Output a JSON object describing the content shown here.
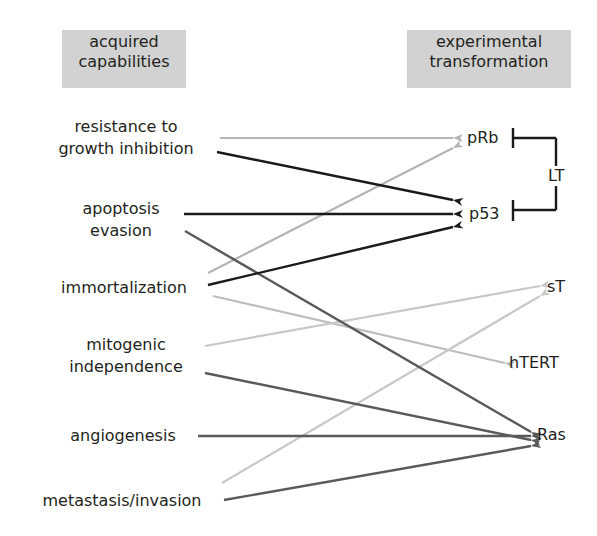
{
  "headers": {
    "left": [
      "acquired",
      "capabilities"
    ],
    "right": [
      "experimental",
      "transformation"
    ]
  },
  "capabilities": [
    {
      "id": "resistance",
      "lines": [
        "resistance to",
        "growth inhibition"
      ]
    },
    {
      "id": "apoptosis",
      "lines": [
        "apoptosis",
        "evasion"
      ]
    },
    {
      "id": "immortalization",
      "lines": [
        "immortalization"
      ]
    },
    {
      "id": "mitogenic",
      "lines": [
        "mitogenic",
        "independence"
      ]
    },
    {
      "id": "angiogenesis",
      "lines": [
        "angiogenesis"
      ]
    },
    {
      "id": "metastasis",
      "lines": [
        "metastasis/invasion"
      ]
    }
  ],
  "transformations": [
    {
      "id": "pRb",
      "label": "pRb"
    },
    {
      "id": "p53",
      "label": "p53"
    },
    {
      "id": "sT",
      "label": "sT"
    },
    {
      "id": "hTERT",
      "label": "hTERT"
    },
    {
      "id": "Ras",
      "label": "Ras"
    }
  ],
  "bracket": {
    "label": "LT",
    "targets": [
      "pRb",
      "p53"
    ]
  },
  "colors": {
    "pRb": "#b4b4b4",
    "p53": "#1a1a1a",
    "sT": "#c8c8c8",
    "hTERT": "#b4b4b4",
    "Ras": "#5a5a5a",
    "header_bg": "#d2d2d2"
  },
  "connections": [
    {
      "from": "pRb",
      "to": "resistance to growth inhibition"
    },
    {
      "from": "pRb",
      "to": "immortalization"
    },
    {
      "from": "p53",
      "to": "resistance to growth inhibition"
    },
    {
      "from": "p53",
      "to": "apoptosis evasion"
    },
    {
      "from": "p53",
      "to": "immortalization"
    },
    {
      "from": "sT",
      "to": "mitogenic independence"
    },
    {
      "from": "sT",
      "to": "metastasis/invasion"
    },
    {
      "from": "hTERT",
      "to": "immortalization"
    },
    {
      "from": "Ras",
      "to": "apoptosis evasion"
    },
    {
      "from": "Ras",
      "to": "mitogenic independence"
    },
    {
      "from": "Ras",
      "to": "angiogenesis"
    },
    {
      "from": "Ras",
      "to": "metastasis/invasion"
    }
  ]
}
